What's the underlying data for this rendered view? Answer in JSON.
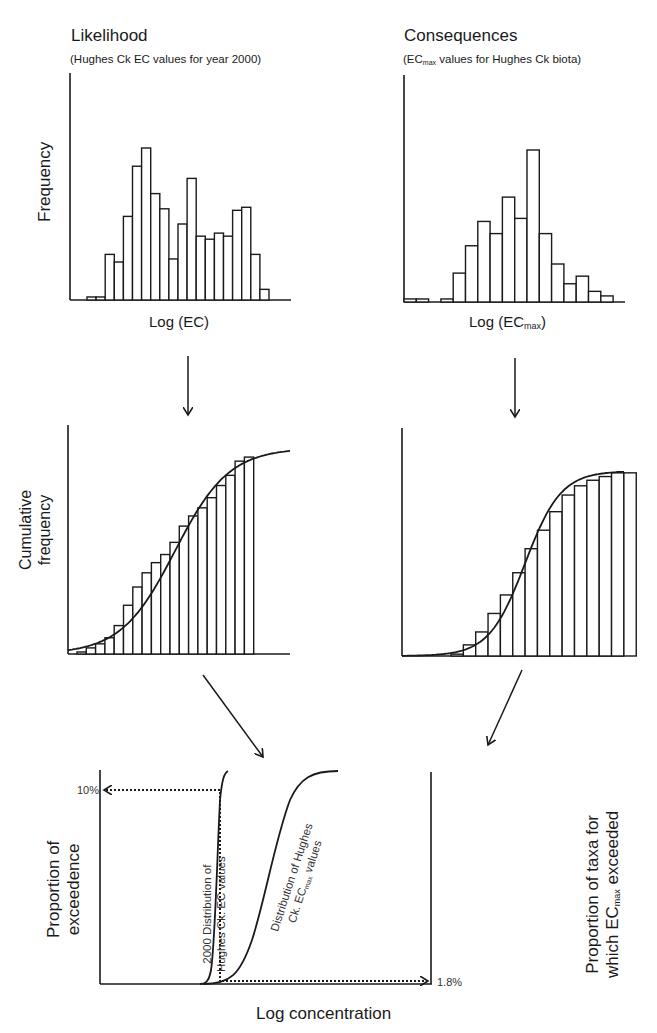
{
  "panels": {
    "likelihood": {
      "title": "Likelihood",
      "subtitle": "(Hughes Ck  EC values for year 2000)",
      "ylabel": "Frequency",
      "xlabel": "Log (EC)"
    },
    "consequences": {
      "title": "Consequences",
      "subtitle_pre": "(EC",
      "subtitle_sub": "max",
      "subtitle_post": " values for Hughes Ck biota)",
      "xlabel_pre": "Log (EC",
      "xlabel_sub": "max",
      "xlabel_post": ")"
    },
    "cumulative": {
      "ylabel_line1": "Cumulative",
      "ylabel_line2": "frequency"
    },
    "exceedance": {
      "ylabel_left_line1": "Proportion of",
      "ylabel_left_line2": "exceedence",
      "ylabel_right_line1": "Proportion of taxa for",
      "ylabel_right_line2_pre": "which EC",
      "ylabel_right_line2_sub": "max",
      "ylabel_right_line2_post": " exceeded",
      "xlabel": "Log concentration",
      "marker_left": "10%",
      "marker_right": "1.8%",
      "curve_left_label_line1": "2000 Distribution of",
      "curve_left_label_line2": "Hughes Ck. EC values",
      "curve_right_label_line1": "Distribution of Hughes",
      "curve_right_label_line2_pre": "Ck. EC",
      "curve_right_label_line2_sub": "max",
      "curve_right_label_line2_post": " values"
    }
  },
  "chart_data": [
    {
      "type": "bar",
      "title": "Likelihood (Hughes Ck EC values for year 2000)",
      "xlabel": "Log (EC)",
      "ylabel": "Frequency",
      "note": "Relative bar heights (0-100) read from pixels; no numeric ticks shown",
      "categories": [
        1,
        2,
        3,
        4,
        5,
        6,
        7,
        8,
        9,
        10,
        11,
        12,
        13,
        14,
        15,
        16,
        17,
        18,
        19,
        20,
        21,
        22
      ],
      "values": [
        2,
        2,
        30,
        25,
        55,
        88,
        100,
        70,
        60,
        27,
        50,
        80,
        42,
        40,
        44,
        42,
        59,
        61,
        30,
        7,
        0,
        0
      ]
    },
    {
      "type": "bar",
      "title": "Consequences (ECmax values for Hughes Ck biota)",
      "xlabel": "Log (ECmax)",
      "ylabel": "Frequency",
      "note": "Relative bar heights (0-100) read from pixels; no numeric ticks shown",
      "categories": [
        1,
        2,
        3,
        4,
        5,
        6,
        7,
        8,
        9,
        10,
        11,
        12,
        13,
        14,
        15,
        16,
        17
      ],
      "values": [
        2,
        2,
        0,
        2,
        19,
        37,
        53,
        45,
        69,
        55,
        100,
        45,
        25,
        12,
        17,
        7,
        4
      ]
    },
    {
      "type": "bar",
      "title": "Cumulative frequency (EC)",
      "ylabel": "Cumulative frequency",
      "note": "Cumulative step bars with fitted sigmoid curve; relative heights 0-100",
      "values": [
        1,
        3,
        5,
        8,
        14,
        24,
        33,
        40,
        45,
        49,
        55,
        63,
        68,
        72,
        77,
        83,
        88,
        95,
        97
      ]
    },
    {
      "type": "bar",
      "title": "Cumulative frequency (ECmax)",
      "ylabel": "Cumulative frequency",
      "note": "Cumulative step bars with fitted sigmoid curve; relative heights 0-100",
      "values": [
        1,
        6,
        13,
        23,
        33,
        45,
        58,
        68,
        78,
        87,
        92,
        95,
        97,
        99,
        99
      ]
    },
    {
      "type": "line",
      "title": "Exceedance overlay",
      "xlabel": "Log concentration",
      "ylabel": "Proportion of exceedence",
      "y2label": "Proportion of taxa for which ECmax exceeded",
      "series": [
        {
          "name": "2000 Distribution of Hughes Ck. EC values",
          "shape": "steep sigmoid"
        },
        {
          "name": "Distribution of Hughes Ck. ECmax values",
          "shape": "gradual sigmoid"
        }
      ],
      "annotations": [
        {
          "label": "10%",
          "axis": "left",
          "meaning": "proportion of exceedence"
        },
        {
          "label": "1.8%",
          "axis": "right",
          "meaning": "proportion of taxa exceeded"
        }
      ]
    }
  ]
}
